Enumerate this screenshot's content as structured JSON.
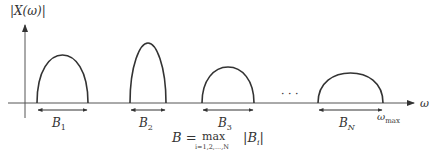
{
  "diagram": {
    "y_axis_label": "|X(ω)|",
    "x_axis_label": "ω",
    "ellipsis": "· · ·",
    "bands": [
      {
        "label": "B",
        "sub": "1",
        "x_start": 37,
        "x_end": 88,
        "peak_y": 55
      },
      {
        "label": "B",
        "sub": "2",
        "x_start": 130,
        "x_end": 166,
        "peak_y": 43
      },
      {
        "label": "B",
        "sub": "3",
        "x_start": 202,
        "x_end": 254,
        "peak_y": 67
      },
      {
        "label": "B",
        "sub": "N",
        "x_start": 318,
        "x_end": 383,
        "peak_y": 73
      }
    ],
    "omega_max": {
      "base": "ω",
      "sub": "max"
    },
    "formula": {
      "lhs": "B =",
      "op": "max",
      "op_sub": "i=1,2,...,N",
      "rhs": "|B",
      "rhs_sub": "i",
      "rhs_end": "|"
    },
    "colors": {
      "line": "#333333",
      "background": "#ffffff"
    }
  }
}
